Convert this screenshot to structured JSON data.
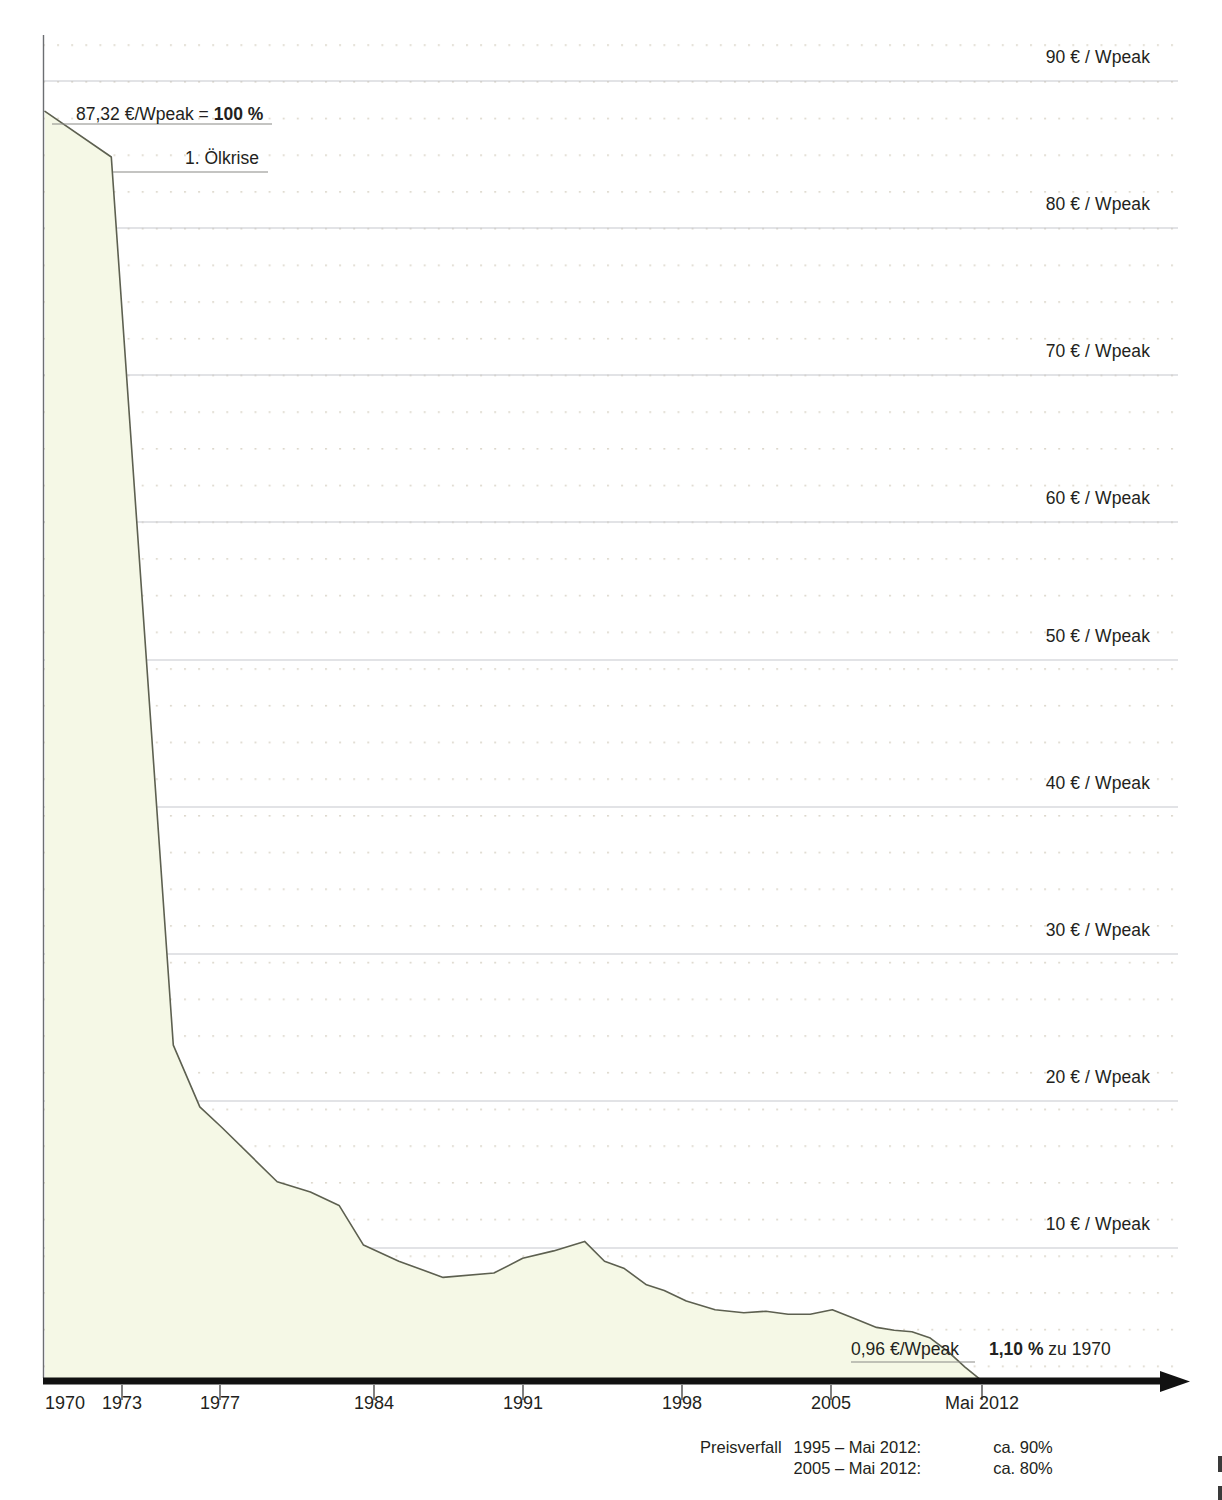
{
  "chart_data": {
    "type": "area",
    "title": "",
    "xlabel": "",
    "ylabel": "€ / Wpeak",
    "xlim": [
      1970,
      2013.6
    ],
    "ylim": [
      0,
      93.6
    ],
    "grid": true,
    "legend": "none",
    "x_tick_labels": [
      "1970",
      "1973",
      "1977",
      "1984",
      "1991",
      "1998",
      "2005",
      "Mai 2012"
    ],
    "x_tick_values": [
      1970,
      1973,
      1977,
      1984,
      1991,
      1998,
      2005,
      2012.37
    ],
    "y_tick_labels": [
      "90 € / Wpeak",
      "80 € / Wpeak",
      "70 € / Wpeak",
      "60 € / Wpeak",
      "50 € / Wpeak",
      "40 € / Wpeak",
      "30 € / Wpeak",
      "20 € / Wpeak",
      "10 € / Wpeak"
    ],
    "y_tick_values": [
      90,
      80,
      70,
      60,
      50,
      40,
      30,
      20,
      10
    ],
    "series": [
      {
        "name": "Modulpreis",
        "unit": "€/Wpeak",
        "x": [
          1970,
          1973,
          1975.8,
          1977,
          1978,
          1980.5,
          1982,
          1983.3,
          1984.4,
          1986,
          1988,
          1990.3,
          1991.6,
          1993,
          1994.4,
          1995.3,
          1996.2,
          1997.2,
          1998,
          1999,
          2000.3,
          2001.6,
          2002.6,
          2003.6,
          2004.6,
          2005.6,
          2006.6,
          2007.6,
          2008.4,
          2009.2,
          2010,
          2010.8,
          2011.6,
          2012.37
        ],
        "y": [
          87.32,
          84.22,
          23.8,
          19.6,
          18.2,
          14.5,
          13.8,
          12.9,
          10.2,
          9.1,
          8.0,
          8.3,
          9.3,
          9.8,
          10.45,
          9.1,
          8.6,
          7.5,
          7.1,
          6.4,
          5.8,
          5.6,
          5.7,
          5.5,
          5.5,
          5.8,
          5.2,
          4.6,
          4.4,
          4.3,
          3.9,
          3.0,
          1.9,
          0.96
        ]
      }
    ],
    "annotations": [
      {
        "name": "start-value",
        "text_plain": "87,32 €/Wpeak = ",
        "text_bold": "100 %",
        "x": 1970,
        "y": 87.32
      },
      {
        "name": "oil-crisis",
        "text_plain": "1. Ölkrise",
        "x": 1973,
        "y": 84.22
      },
      {
        "name": "end-value",
        "text_plain": "0,96 €/Wpeak",
        "x": 2012.37,
        "y": 0.96
      },
      {
        "name": "end-percent",
        "text_bold": "1,10 %",
        "text_plain": " zu 1970",
        "x": 2012.37,
        "y": 0.96
      }
    ],
    "colors": {
      "area_fill": "#f6f8e6",
      "line": "#5a5c4a",
      "gridline": "#c9cbd0",
      "dot_grid": "#d8d2c8",
      "axis": "#1a1a1a",
      "text": "#231f20"
    }
  },
  "annotations": {
    "start_value_text": "87,32 €/Wpeak = ",
    "start_value_bold": "100 %",
    "oil_crisis": "1. Ölkrise",
    "end_value": "0,96 €/Wpeak",
    "end_percent_bold": "1,10 %",
    "end_percent_rest": " zu 1970"
  },
  "y_axis": {
    "labels": [
      "90 € / Wpeak",
      "80 € / Wpeak",
      "70 € / Wpeak",
      "60 € / Wpeak",
      "50 € / Wpeak",
      "40 € / Wpeak",
      "30 € / Wpeak",
      "20 € / Wpeak",
      "10 € / Wpeak"
    ]
  },
  "x_axis": {
    "labels": [
      "1970",
      "1973",
      "1977",
      "1984",
      "1991",
      "1998",
      "2005",
      "Mai 2012"
    ]
  },
  "footer": {
    "title": "Preisverfall",
    "rows": [
      {
        "range": "1995 – Mai 2012:",
        "value": "ca. 90%"
      },
      {
        "range": "2005 – Mai 2012:",
        "value": "ca. 80%"
      }
    ]
  }
}
